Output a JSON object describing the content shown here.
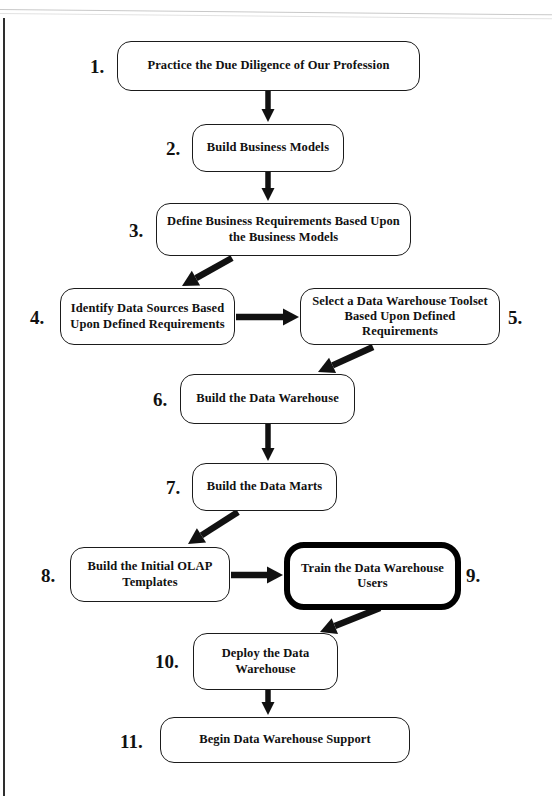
{
  "document": {
    "kind": "flowchart",
    "title": "Data Warehouse Implementation Steps"
  },
  "nodes": [
    {
      "number": "1.",
      "label": "Practice the Due Diligence of Our Profession",
      "name": "flow-node-1",
      "emphasis": false,
      "x": 117,
      "y": 41,
      "w": 303,
      "h": 50,
      "num_x": 90,
      "num_y": 57,
      "num_align": "left"
    },
    {
      "number": "2.",
      "label": "Build Business Models",
      "name": "flow-node-2",
      "emphasis": false,
      "x": 192,
      "y": 124,
      "w": 152,
      "h": 48,
      "num_x": 166,
      "num_y": 139,
      "num_align": "left"
    },
    {
      "number": "3.",
      "label": "Define Business Requirements Based Upon the Business Models",
      "name": "flow-node-3",
      "emphasis": false,
      "x": 156,
      "y": 203,
      "w": 255,
      "h": 53,
      "num_x": 129,
      "num_y": 221,
      "num_align": "left"
    },
    {
      "number": "4.",
      "label": "Identify Data Sources Based Upon Defined Requirements",
      "name": "flow-node-4",
      "emphasis": false,
      "x": 60,
      "y": 288,
      "w": 175,
      "h": 57,
      "num_x": 30,
      "num_y": 308,
      "num_align": "left"
    },
    {
      "number": "5.",
      "label": "Select a Data Warehouse Toolset Based Upon Defined Requirements",
      "name": "flow-node-5",
      "emphasis": false,
      "x": 300,
      "y": 288,
      "w": 200,
      "h": 57,
      "num_x": 508,
      "num_y": 308,
      "num_align": "left"
    },
    {
      "number": "6.",
      "label": "Build the Data Warehouse",
      "name": "flow-node-6",
      "emphasis": false,
      "x": 180,
      "y": 374,
      "w": 175,
      "h": 50,
      "num_x": 153,
      "num_y": 390,
      "num_align": "left"
    },
    {
      "number": "7.",
      "label": "Build the Data Marts",
      "name": "flow-node-7",
      "emphasis": false,
      "x": 192,
      "y": 463,
      "w": 145,
      "h": 48,
      "num_x": 166,
      "num_y": 478,
      "num_align": "left"
    },
    {
      "number": "8.",
      "label": "Build the Initial OLAP Templates",
      "name": "flow-node-8",
      "emphasis": false,
      "x": 70,
      "y": 547,
      "w": 160,
      "h": 55,
      "num_x": 41,
      "num_y": 566,
      "num_align": "left"
    },
    {
      "number": "9.",
      "label": "Train the Data Warehouse Users",
      "name": "flow-node-9",
      "emphasis": true,
      "x": 284,
      "y": 542,
      "w": 177,
      "h": 68,
      "num_x": 466,
      "num_y": 566,
      "num_align": "left"
    },
    {
      "number": "10.",
      "label": "Deploy the Data Warehouse",
      "name": "flow-node-10",
      "emphasis": false,
      "x": 193,
      "y": 633,
      "w": 145,
      "h": 57,
      "num_x": 155,
      "num_y": 652,
      "num_align": "left"
    },
    {
      "number": "11.",
      "label": "Begin Data Warehouse Support",
      "name": "flow-node-11",
      "emphasis": false,
      "x": 160,
      "y": 717,
      "w": 250,
      "h": 46,
      "num_x": 120,
      "num_y": 732,
      "num_align": "left"
    }
  ],
  "connectors": [
    {
      "name": "arrow-1-to-2",
      "from": "1",
      "to": "2",
      "kind": "vertical-down",
      "x1": 268,
      "y1": 91,
      "x2": 268,
      "y2": 122
    },
    {
      "name": "arrow-2-to-3",
      "from": "2",
      "to": "3",
      "kind": "vertical-down",
      "x1": 268,
      "y1": 172,
      "x2": 268,
      "y2": 201
    },
    {
      "name": "arrow-3-to-4",
      "from": "3",
      "to": "4",
      "kind": "diagonal-down-left",
      "x1": 232,
      "y1": 258,
      "x2": 182,
      "y2": 286
    },
    {
      "name": "arrow-4-to-5",
      "from": "4",
      "to": "5",
      "kind": "horizontal-right",
      "x1": 236,
      "y1": 317,
      "x2": 299,
      "y2": 317
    },
    {
      "name": "arrow-5-to-6",
      "from": "5",
      "to": "6",
      "kind": "diagonal-down-left",
      "x1": 373,
      "y1": 347,
      "x2": 318,
      "y2": 372
    },
    {
      "name": "arrow-6-to-7",
      "from": "6",
      "to": "7",
      "kind": "vertical-down",
      "x1": 268,
      "y1": 424,
      "x2": 268,
      "y2": 461
    },
    {
      "name": "arrow-7-to-8",
      "from": "7",
      "to": "8",
      "kind": "diagonal-down-left",
      "x1": 238,
      "y1": 512,
      "x2": 188,
      "y2": 544
    },
    {
      "name": "arrow-8-to-9",
      "from": "8",
      "to": "9",
      "kind": "horizontal-right",
      "x1": 231,
      "y1": 575,
      "x2": 283,
      "y2": 575
    },
    {
      "name": "arrow-9-to-10",
      "from": "9",
      "to": "10",
      "kind": "diagonal-down-left",
      "x1": 380,
      "y1": 608,
      "x2": 320,
      "y2": 632
    },
    {
      "name": "arrow-10-to-11",
      "from": "10",
      "to": "11",
      "kind": "vertical-down",
      "x1": 268,
      "y1": 690,
      "x2": 268,
      "y2": 715
    }
  ],
  "colors": {
    "ink": "#111111",
    "box_border": "#1b1b1b",
    "emphasis_border": "#000000",
    "arrow": "#111111",
    "page_background": "#ffffff",
    "scan_edge": "#2e2e2e"
  }
}
